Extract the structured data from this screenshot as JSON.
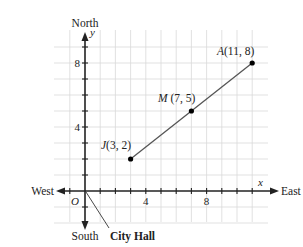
{
  "directions": {
    "north": "North",
    "south": "South",
    "east": "East",
    "west": "West"
  },
  "axes": {
    "x_label": "x",
    "y_label": "y",
    "origin_label": "O",
    "x_ticks": [
      "4",
      "8"
    ],
    "y_ticks": [
      "4",
      "8"
    ],
    "x_range": [
      -1,
      12
    ],
    "y_range": [
      -2,
      9
    ]
  },
  "points": [
    {
      "name": "J",
      "label": "J(3, 2)",
      "x": 3,
      "y": 2
    },
    {
      "name": "M",
      "label": "M(7, 5)",
      "x": 7,
      "y": 5
    },
    {
      "name": "A",
      "label": "A(11, 8)",
      "x": 11,
      "y": 8
    }
  ],
  "callout": {
    "label": "City Hall"
  },
  "colors": {
    "grid": "#d9d9d9",
    "axis": "#222222",
    "segment": "#555555",
    "point": "#000000"
  }
}
